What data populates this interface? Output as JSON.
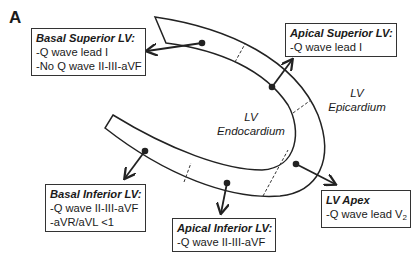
{
  "panel_label": "A",
  "regions": {
    "endocardium": {
      "line1": "LV",
      "line2": "Endocardium"
    },
    "epicardium": {
      "line1": "LV",
      "line2": "Epicardium"
    }
  },
  "boxes": {
    "basal_superior": {
      "title": "Basal Superior LV:",
      "lines": [
        "-Q wave lead I",
        "-No Q wave II-III-aVF"
      ]
    },
    "apical_superior": {
      "title": "Apical Superior LV:",
      "lines": [
        "-Q wave lead I"
      ]
    },
    "basal_inferior": {
      "title": "Basal Inferior LV:",
      "lines": [
        "-Q wave II-III-aVF",
        "-aVR/aVL <1"
      ]
    },
    "apical_inferior": {
      "title": "Apical Inferior LV:",
      "lines": [
        "-Q wave II-III-aVF"
      ]
    },
    "lv_apex": {
      "title": "LV Apex",
      "line_prefix": "-Q wave lead V",
      "line_sub": "2"
    }
  },
  "colors": {
    "stroke": "#222222",
    "box_border": "#333333",
    "text": "#1a1a1a"
  }
}
